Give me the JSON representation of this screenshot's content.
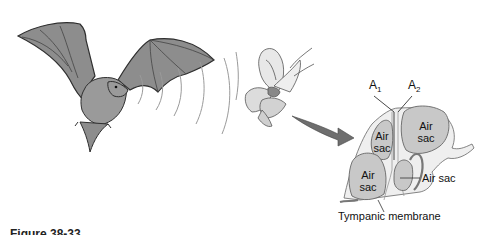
{
  "figure": {
    "caption": "Figure 38-33"
  },
  "illustration": {
    "bat": {
      "label": "bat",
      "fill": "#8a8a8a",
      "outline": "#333333"
    },
    "sound_waves": {
      "count": 5,
      "color": "#9a9a9a"
    },
    "moth": {
      "label": "moth"
    },
    "arrow": {
      "fill": "#6e6e6e"
    }
  },
  "ear_diagram": {
    "receptor_labels": {
      "a1": {
        "main": "A",
        "sub": "1"
      },
      "a2": {
        "main": "A",
        "sub": "2"
      }
    },
    "air_sacs": [
      {
        "line1": "Air",
        "line2": "sac"
      },
      {
        "line1": "Air",
        "line2": "sac"
      },
      {
        "line1": "Air",
        "line2": "sac"
      }
    ],
    "air_sac_callout": "Air sac",
    "tympanic_membrane_label": "Tympanic membrane",
    "sac_fill": "#c8c8c8",
    "wall_fill": "#eeeeee"
  }
}
